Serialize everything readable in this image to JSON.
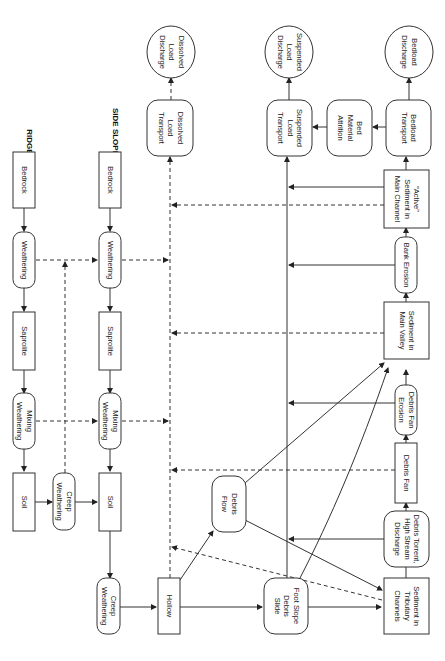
{
  "diagram": {
    "orientation": "rotated-90-ccw",
    "colors": {
      "stroke": "#333333",
      "background": "#ffffff",
      "text": "#222222"
    },
    "headers": {
      "ridge": "RIDGE",
      "side_slope": "SIDE SLOPE"
    },
    "nodes": {
      "ridge_bedrock": {
        "lines": [
          "Bedrock"
        ],
        "shape": "rect"
      },
      "ridge_weathering": {
        "lines": [
          "Weathering"
        ],
        "shape": "rounded"
      },
      "ridge_saprolite": {
        "lines": [
          "Saprolite"
        ],
        "shape": "rect"
      },
      "ridge_mixing_weathering": {
        "lines": [
          "Mixing",
          "Weathering"
        ],
        "shape": "rounded"
      },
      "ridge_soil": {
        "lines": [
          "Soil"
        ],
        "shape": "rect"
      },
      "creep_weathering_1": {
        "lines": [
          "Creep",
          "Weathering"
        ],
        "shape": "rounded"
      },
      "side_bedrock": {
        "lines": [
          "Bedrock"
        ],
        "shape": "rect"
      },
      "side_weathering": {
        "lines": [
          "Weathering"
        ],
        "shape": "rounded"
      },
      "side_saprolite": {
        "lines": [
          "Saprolite"
        ],
        "shape": "rect"
      },
      "side_mixing_weathering": {
        "lines": [
          "Mixing",
          "Weathering"
        ],
        "shape": "rounded"
      },
      "side_soil": {
        "lines": [
          "Soil"
        ],
        "shape": "rect"
      },
      "creep_weathering_2": {
        "lines": [
          "Creep",
          "Weathering"
        ],
        "shape": "rounded"
      },
      "hollow": {
        "lines": [
          "Hollow"
        ],
        "shape": "rect"
      },
      "dissolved_load_transport": {
        "lines": [
          "Dissolved",
          "Load",
          "Transport"
        ],
        "shape": "rounded"
      },
      "dissolved_load_discharge": {
        "lines": [
          "Dissolved",
          "Load",
          "Discharge"
        ],
        "shape": "circle"
      },
      "debris_flow": {
        "lines": [
          "Debris",
          "Flow"
        ],
        "shape": "rounded"
      },
      "foot_slope_debris_slide": {
        "lines": [
          "Foot Slope",
          "Debris",
          "Slide"
        ],
        "shape": "rounded"
      },
      "suspended_load_transport": {
        "lines": [
          "Suspended",
          "Load",
          "Transport"
        ],
        "shape": "rounded"
      },
      "suspended_load_discharge": {
        "lines": [
          "Suspended",
          "Load",
          "Discharge"
        ],
        "shape": "circle"
      },
      "bed_material_attrition": {
        "lines": [
          "Bed",
          "Material",
          "Attrition"
        ],
        "shape": "rounded"
      },
      "bedload_transport": {
        "lines": [
          "Bedload",
          "Transport"
        ],
        "shape": "rounded"
      },
      "bedload_discharge": {
        "lines": [
          "Bedload",
          "Discharge"
        ],
        "shape": "circle"
      },
      "active_sediment_main_channel": {
        "lines": [
          "“Active”",
          "Sediment in",
          "Main Channel"
        ],
        "shape": "rect"
      },
      "bank_erosion": {
        "lines": [
          "Bank Erosion"
        ],
        "shape": "rounded"
      },
      "sediment_main_valley": {
        "lines": [
          "Sediment in",
          "Main Valley"
        ],
        "shape": "rect"
      },
      "debris_fan_erosion": {
        "lines": [
          "Debris Fan",
          "Erosion"
        ],
        "shape": "rounded"
      },
      "debris_fan": {
        "lines": [
          "Debris Fan"
        ],
        "shape": "rect"
      },
      "debris_torrent": {
        "lines": [
          "Debris Torrent,",
          "High Stream",
          "Discharge"
        ],
        "shape": "rounded"
      },
      "sediment_tributary_channels": {
        "lines": [
          "Sediment in",
          "Tributary",
          "Channels"
        ],
        "shape": "rect"
      }
    }
  }
}
